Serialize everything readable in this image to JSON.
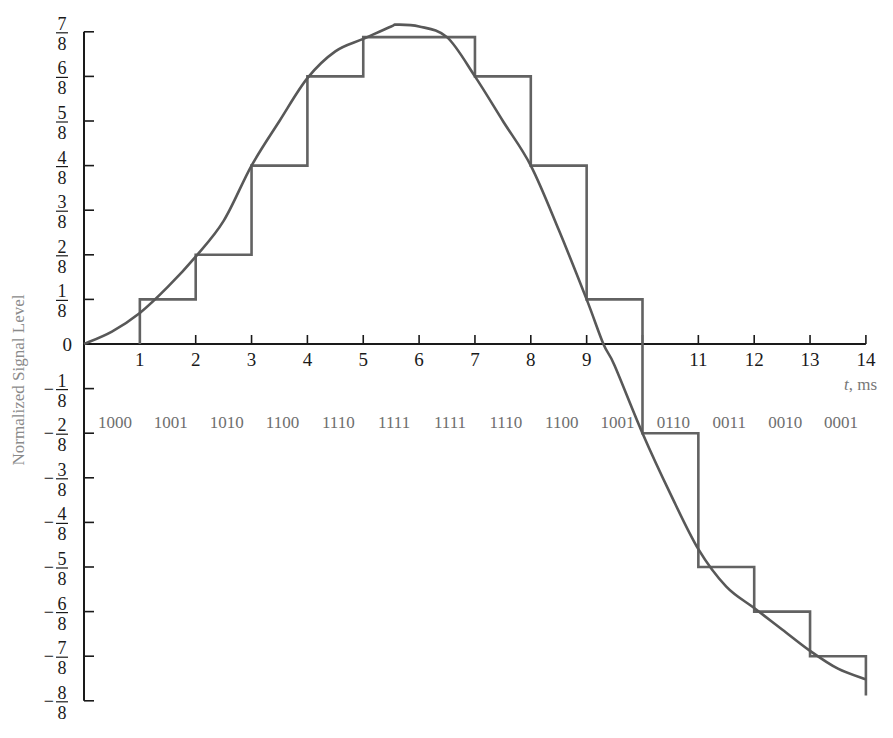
{
  "chart_data": {
    "type": "line",
    "title": "",
    "xlabel": "t, ms",
    "ylabel": "Normalized Signal Level",
    "xlim": [
      0,
      14
    ],
    "ylim": [
      -1,
      0.875
    ],
    "grid": false,
    "legend": null,
    "x_ticks": [
      1,
      2,
      3,
      4,
      5,
      6,
      7,
      8,
      9,
      10,
      11,
      12,
      13,
      14
    ],
    "x_tick_labels": [
      "1",
      "2",
      "3",
      "4",
      "5",
      "6",
      "7",
      "8",
      "9",
      "",
      "11",
      "12",
      "13",
      "14"
    ],
    "y_ticks": [
      {
        "value": 0.875,
        "label": "7/8",
        "sign": "",
        "num": "7",
        "den": "8"
      },
      {
        "value": 0.75,
        "label": "6/8",
        "sign": "",
        "num": "6",
        "den": "8"
      },
      {
        "value": 0.625,
        "label": "5/8",
        "sign": "",
        "num": "5",
        "den": "8"
      },
      {
        "value": 0.5,
        "label": "4/8",
        "sign": "",
        "num": "4",
        "den": "8"
      },
      {
        "value": 0.375,
        "label": "3/8",
        "sign": "",
        "num": "3",
        "den": "8"
      },
      {
        "value": 0.25,
        "label": "2/8",
        "sign": "",
        "num": "2",
        "den": "8"
      },
      {
        "value": 0.125,
        "label": "1/8",
        "sign": "",
        "num": "1",
        "den": "8"
      },
      {
        "value": 0,
        "label": "0",
        "sign": "",
        "num": "0",
        "den": ""
      },
      {
        "value": -0.125,
        "label": "-1/8",
        "sign": "−",
        "num": "1",
        "den": "8"
      },
      {
        "value": -0.25,
        "label": "-2/8",
        "sign": "−",
        "num": "2",
        "den": "8"
      },
      {
        "value": -0.375,
        "label": "-3/8",
        "sign": "−",
        "num": "3",
        "den": "8"
      },
      {
        "value": -0.5,
        "label": "-4/8",
        "sign": "−",
        "num": "4",
        "den": "8"
      },
      {
        "value": -0.625,
        "label": "-5/8",
        "sign": "−",
        "num": "5",
        "den": "8"
      },
      {
        "value": -0.75,
        "label": "-6/8",
        "sign": "−",
        "num": "6",
        "den": "8"
      },
      {
        "value": -0.875,
        "label": "-7/8",
        "sign": "−",
        "num": "7",
        "den": "8"
      },
      {
        "value": -1,
        "label": "-8/8",
        "sign": "−",
        "num": "8",
        "den": "8"
      }
    ],
    "series": [
      {
        "name": "Analog signal",
        "style": "smooth curve",
        "x": [
          0,
          0.5,
          1,
          1.5,
          2,
          2.5,
          3,
          3.5,
          4,
          4.5,
          5,
          5.5,
          5.6,
          6,
          6.5,
          7,
          7.5,
          8,
          8.5,
          9,
          9.3,
          9.5,
          10,
          10.5,
          11,
          11.5,
          12,
          12.5,
          13,
          13.5,
          14
        ],
        "y": [
          0,
          0.035,
          0.087,
          0.16,
          0.245,
          0.345,
          0.5,
          0.625,
          0.745,
          0.82,
          0.855,
          0.89,
          0.895,
          0.89,
          0.86,
          0.75,
          0.625,
          0.5,
          0.32,
          0.125,
          0,
          -0.06,
          -0.25,
          -0.42,
          -0.575,
          -0.68,
          -0.74,
          -0.8,
          -0.86,
          -0.91,
          -0.94
        ]
      },
      {
        "name": "Quantized (sample-and-hold) signal",
        "style": "step",
        "steps": [
          {
            "t_start": 1,
            "t_end": 2,
            "level": 0.125
          },
          {
            "t_start": 2,
            "t_end": 3,
            "level": 0.25
          },
          {
            "t_start": 3,
            "t_end": 4,
            "level": 0.5
          },
          {
            "t_start": 4,
            "t_end": 5,
            "level": 0.75
          },
          {
            "t_start": 5,
            "t_end": 7,
            "level": 0.86
          },
          {
            "t_start": 7,
            "t_end": 8,
            "level": 0.75
          },
          {
            "t_start": 8,
            "t_end": 9,
            "level": 0.5
          },
          {
            "t_start": 9,
            "t_end": 10,
            "level": 0.125
          },
          {
            "t_start": 10,
            "t_end": 11,
            "level": -0.25
          },
          {
            "t_start": 11,
            "t_end": 12,
            "level": -0.625
          },
          {
            "t_start": 12,
            "t_end": 13,
            "level": -0.75
          },
          {
            "t_start": 13,
            "t_end": 14,
            "level": -0.875
          }
        ],
        "final_drop_to": -0.985
      }
    ],
    "annotations": {
      "binary_codes": [
        "1000",
        "1001",
        "1010",
        "1100",
        "1110",
        "1111",
        "1111",
        "1110",
        "1100",
        "1001",
        "0110",
        "0011",
        "0010",
        "0001"
      ],
      "binary_codes_row_level": -0.22
    },
    "colors": {
      "axis": "#1a1a1a",
      "curve": "#585858",
      "staircase": "#626262",
      "labels_gray": "#777777"
    }
  }
}
